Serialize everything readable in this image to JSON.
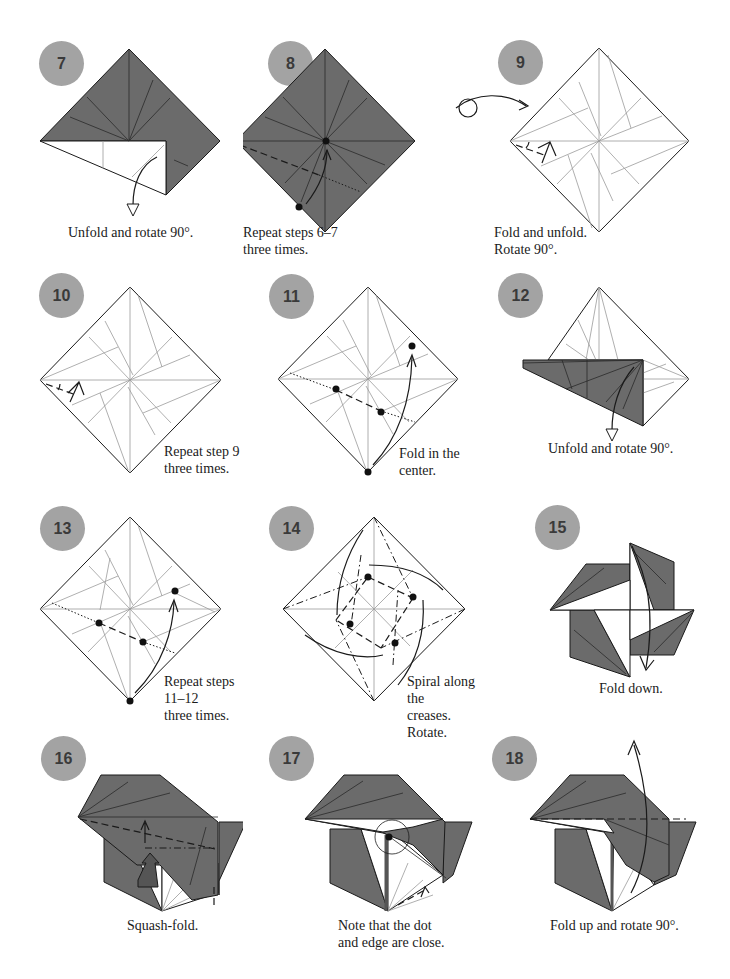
{
  "page": {
    "colors": {
      "paper_dark": "#6b6b6b",
      "paper_light": "#ffffff",
      "badge": "#a3a3a3",
      "badge_text": "#3a3a3a",
      "line": "#1a1a1a"
    }
  },
  "steps": [
    {
      "number": "7",
      "caption": "Unfold and rotate 90°."
    },
    {
      "number": "8",
      "caption": "Repeat steps 6–7\nthree times."
    },
    {
      "number": "9",
      "caption": "Fold and unfold.\nRotate 90°."
    },
    {
      "number": "10",
      "caption": "Repeat step 9\nthree times."
    },
    {
      "number": "11",
      "caption": "Fold in the center."
    },
    {
      "number": "12",
      "caption": "Unfold and rotate 90°."
    },
    {
      "number": "13",
      "caption": "Repeat steps 11–12\nthree times."
    },
    {
      "number": "14",
      "caption": "Spiral along the\ncreases. Rotate."
    },
    {
      "number": "15",
      "caption": "Fold down."
    },
    {
      "number": "16",
      "caption": "Squash-fold."
    },
    {
      "number": "17",
      "caption": "Note that the dot\nand edge are close."
    },
    {
      "number": "18",
      "caption": "Fold up and rotate 90°."
    }
  ],
  "symbols": {
    "turn_over": "turn-over-icon"
  }
}
